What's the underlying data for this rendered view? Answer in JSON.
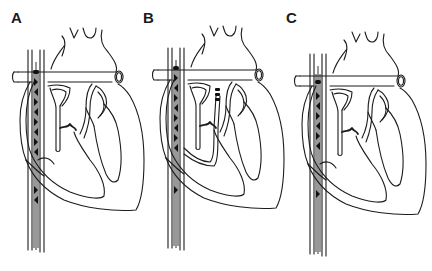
{
  "figure": {
    "panels": [
      {
        "id": "A",
        "label": "A",
        "catheter_variant": "right-atrium-coil"
      },
      {
        "id": "B",
        "label": "B",
        "catheter_variant": "right-atrium-coil-with-ventricular-lead"
      },
      {
        "id": "C",
        "label": "C",
        "catheter_variant": "right-atrium-coil-short"
      }
    ],
    "colors": {
      "line": "#1c1c1c",
      "background": "#ffffff",
      "marker": "#111111"
    }
  }
}
